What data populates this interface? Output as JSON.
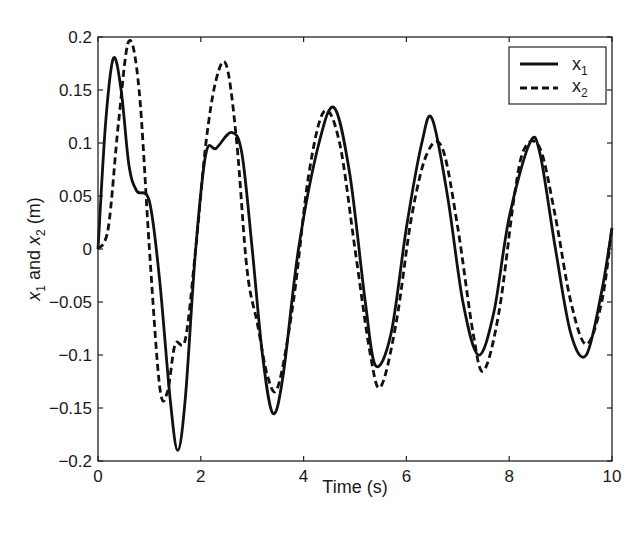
{
  "chart_data": {
    "type": "line",
    "title": "",
    "xlabel": "Time (s)",
    "ylabel": "x1 and x2 (m)",
    "xlim": [
      0,
      10
    ],
    "ylim": [
      -0.2,
      0.2
    ],
    "xticks": [
      0,
      2,
      4,
      6,
      8,
      10
    ],
    "yticks": [
      -0.2,
      -0.15,
      -0.1,
      -0.05,
      0,
      0.05,
      0.1,
      0.15,
      0.2
    ],
    "grid": false,
    "legend_position": "upper right",
    "series": [
      {
        "name": "x1",
        "style": "solid",
        "color": "#111111",
        "x": [
          0,
          0.15,
          0.3,
          0.45,
          0.6,
          0.75,
          1.0,
          1.2,
          1.4,
          1.55,
          1.7,
          1.9,
          2.1,
          2.3,
          2.6,
          2.8,
          3.0,
          3.2,
          3.4,
          3.6,
          3.9,
          4.3,
          4.6,
          4.9,
          5.2,
          5.4,
          5.7,
          6.0,
          6.3,
          6.5,
          6.8,
          7.1,
          7.4,
          7.7,
          8.0,
          8.4,
          8.6,
          8.9,
          9.2,
          9.5,
          9.8,
          10.0
        ],
        "y": [
          0,
          0.12,
          0.18,
          0.15,
          0.08,
          0.055,
          0.045,
          -0.03,
          -0.14,
          -0.19,
          -0.14,
          0.0,
          0.09,
          0.095,
          0.11,
          0.09,
          0.0,
          -0.1,
          -0.155,
          -0.12,
          0.0,
          0.1,
          0.133,
          0.07,
          -0.05,
          -0.11,
          -0.08,
          0.02,
          0.1,
          0.123,
          0.05,
          -0.05,
          -0.1,
          -0.06,
          0.03,
          0.1,
          0.09,
          0.0,
          -0.08,
          -0.1,
          -0.04,
          0.02
        ]
      },
      {
        "name": "x2",
        "style": "dashed",
        "color": "#111111",
        "x": [
          0,
          0.2,
          0.4,
          0.6,
          0.8,
          1.0,
          1.2,
          1.35,
          1.5,
          1.7,
          1.9,
          2.1,
          2.3,
          2.5,
          2.7,
          2.9,
          3.1,
          3.3,
          3.5,
          3.8,
          4.1,
          4.4,
          4.7,
          5.0,
          5.3,
          5.5,
          5.8,
          6.1,
          6.4,
          6.7,
          7.0,
          7.3,
          7.5,
          7.8,
          8.1,
          8.3,
          8.6,
          8.9,
          9.2,
          9.5,
          9.8,
          10.0
        ],
        "y": [
          0,
          0.02,
          0.12,
          0.196,
          0.15,
          0.0,
          -0.13,
          -0.135,
          -0.09,
          -0.085,
          0.0,
          0.1,
          0.16,
          0.173,
          0.1,
          -0.02,
          -0.07,
          -0.12,
          -0.13,
          -0.05,
          0.07,
          0.13,
          0.1,
          0.0,
          -0.1,
          -0.13,
          -0.07,
          0.03,
          0.09,
          0.095,
          0.02,
          -0.08,
          -0.115,
          -0.06,
          0.05,
          0.095,
          0.095,
          0.03,
          -0.05,
          -0.09,
          -0.05,
          0.02
        ]
      }
    ]
  },
  "axes": {
    "xlabel": "Time (s)",
    "ylabel_parts": {
      "a": "x",
      "a_sub": "1",
      "mid": " and ",
      "b": "x",
      "b_sub": "2",
      "end": " (m)"
    },
    "xtick_labels": [
      "0",
      "2",
      "4",
      "6",
      "8",
      "10"
    ],
    "ytick_labels": [
      "0.2",
      "0.15",
      "0.1",
      "0.05",
      "0",
      "−0.05",
      "−0.1",
      "−0.15",
      "−0.2"
    ]
  },
  "legend": {
    "items": [
      {
        "label": "x",
        "sub": "1",
        "style": "solid"
      },
      {
        "label": "x",
        "sub": "2",
        "style": "dashed"
      }
    ]
  }
}
